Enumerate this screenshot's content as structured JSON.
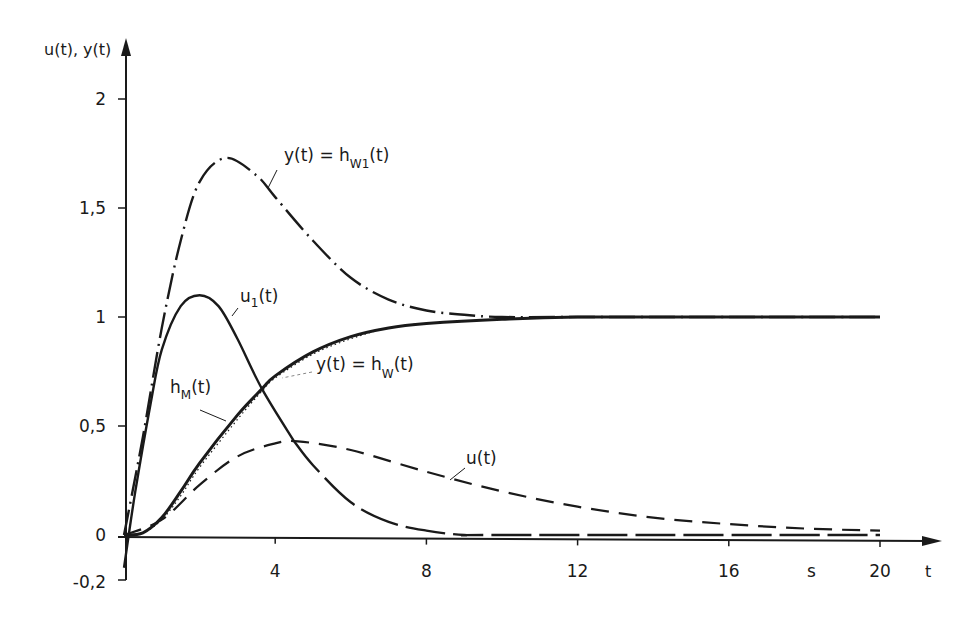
{
  "chart_data": {
    "type": "line",
    "title": "",
    "xlabel": "t",
    "x_unit": "s",
    "ylabel": "u(t), y(t)",
    "xlim": [
      0,
      20
    ],
    "ylim": [
      -0.2,
      2
    ],
    "grid": false,
    "legend": "inline labels",
    "x_ticks": [
      {
        "value": 4,
        "label": "4"
      },
      {
        "value": 8,
        "label": "8"
      },
      {
        "value": 12,
        "label": "12"
      },
      {
        "value": 16,
        "label": "16"
      },
      {
        "value": 20,
        "label": "20"
      }
    ],
    "y_ticks": [
      {
        "value": 2,
        "label": "2"
      },
      {
        "value": 1.5,
        "label": "1,5"
      },
      {
        "value": 1,
        "label": "1"
      },
      {
        "value": 0.5,
        "label": "0,5"
      },
      {
        "value": 0,
        "label": "0"
      },
      {
        "value": -0.2,
        "label": "-0,2"
      }
    ],
    "series": [
      {
        "name": "y(t) = h_W1(t)",
        "label_main": "y(t) = h",
        "label_sub": "W1",
        "label_tail": "(t)",
        "style": "dash-dot",
        "x": [
          0,
          0.5,
          1,
          1.5,
          2,
          2.7,
          3.5,
          4,
          5,
          6,
          7,
          8,
          9,
          10,
          12,
          16,
          20
        ],
        "values": [
          0,
          0.45,
          0.95,
          1.35,
          1.62,
          1.73,
          1.65,
          1.55,
          1.35,
          1.18,
          1.08,
          1.03,
          1.01,
          1.0,
          1.0,
          1.0,
          1.0
        ]
      },
      {
        "name": "u1(t)",
        "label_main": "u",
        "label_sub": "1",
        "label_tail": "(t)",
        "style": "solid-then-long-dash",
        "x": [
          0,
          0.3,
          0.7,
          1,
          1.5,
          2,
          2.5,
          3,
          3.65,
          4.5,
          5,
          6,
          7,
          8,
          9,
          10,
          20
        ],
        "values": [
          -0.15,
          0.2,
          0.6,
          0.85,
          1.05,
          1.1,
          1.05,
          0.9,
          0.67,
          0.43,
          0.32,
          0.15,
          0.06,
          0.02,
          0.0,
          0.0,
          0.0
        ]
      },
      {
        "name": "y(t) = h_W(t)",
        "label_main": "y(t) = h",
        "label_sub": "W",
        "label_tail": "(t)",
        "style": "solid-thick",
        "x": [
          0,
          0.5,
          1,
          1.5,
          2,
          3,
          3.65,
          4,
          5,
          6,
          7,
          8,
          10,
          12,
          16,
          20
        ],
        "values": [
          0,
          0.01,
          0.08,
          0.2,
          0.33,
          0.55,
          0.67,
          0.73,
          0.84,
          0.91,
          0.95,
          0.97,
          0.99,
          1.0,
          1.0,
          1.0
        ]
      },
      {
        "name": "h_M(t)",
        "label_main": "h",
        "label_sub": "M",
        "label_tail": "(t)",
        "style": "dotted",
        "x": [
          0,
          0.5,
          1,
          1.5,
          2,
          3,
          3.65,
          4,
          5,
          6,
          7,
          8,
          10,
          12,
          16,
          20
        ],
        "values": [
          0,
          0.01,
          0.07,
          0.18,
          0.31,
          0.53,
          0.66,
          0.72,
          0.83,
          0.9,
          0.95,
          0.97,
          0.99,
          1.0,
          1.0,
          1.0
        ]
      },
      {
        "name": "u(t)",
        "label_main": "u(t)",
        "label_sub": "",
        "label_tail": "",
        "style": "dashed",
        "x": [
          0,
          1,
          2,
          3,
          4,
          4.6,
          6,
          8,
          10,
          12,
          14,
          16,
          18,
          20
        ],
        "values": [
          0,
          0.07,
          0.23,
          0.36,
          0.42,
          0.43,
          0.39,
          0.29,
          0.2,
          0.13,
          0.08,
          0.05,
          0.03,
          0.02
        ]
      }
    ]
  },
  "axes": {
    "y_title": "u(t), y(t)",
    "x_title": "t",
    "x_unit": "s"
  }
}
